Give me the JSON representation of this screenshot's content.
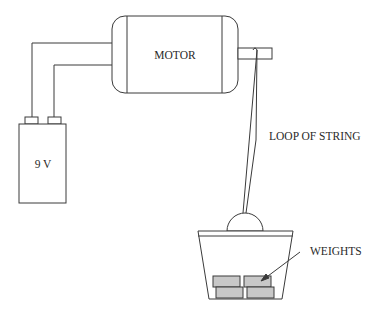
{
  "diagram": {
    "type": "physics apparatus",
    "labels": {
      "motor": "MOTOR",
      "battery": "9 V",
      "string": "LOOP OF STRING",
      "weights": "WEIGHTS"
    },
    "colors": {
      "stroke": "#3a3a3a",
      "weight_fill": "#c8c8c8",
      "background": "#ffffff"
    }
  }
}
